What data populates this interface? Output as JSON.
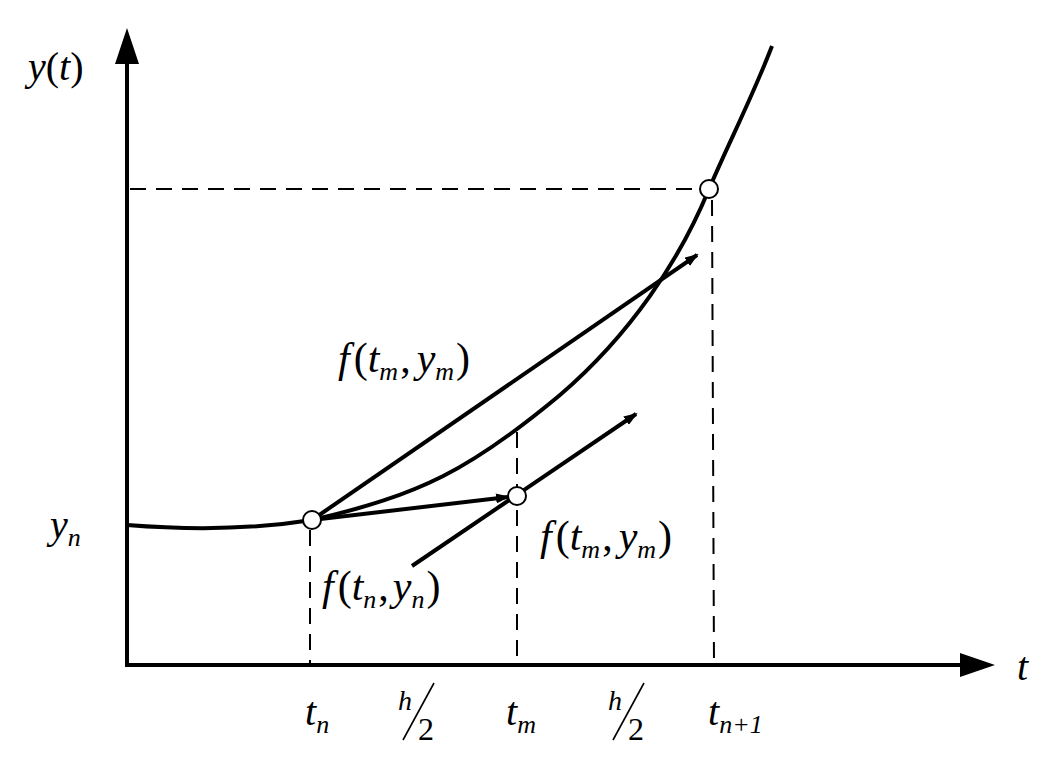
{
  "diagram": {
    "axes": {
      "y_label": {
        "main": "y",
        "open": "(",
        "arg": "t",
        "close": ")"
      },
      "x_label": "t",
      "y_tick": {
        "main": "y",
        "sub": "n"
      }
    },
    "x_ticks": [
      {
        "main": "t",
        "sub": "n"
      },
      {
        "main": "t",
        "sub": "m"
      },
      {
        "main": "t",
        "sub": "n+1"
      }
    ],
    "intervals": [
      {
        "num": "h",
        "den": "2"
      },
      {
        "num": "h",
        "den": "2"
      }
    ],
    "slope_labels": {
      "upper": {
        "f": "f",
        "open": "(",
        "t": "t",
        "t_sub": "m",
        "comma": ",",
        "y": "y",
        "y_sub": "m",
        "close": ")"
      },
      "middle": {
        "f": "f",
        "open": "(",
        "t": "t",
        "t_sub": "m",
        "comma": ",",
        "y": "y",
        "y_sub": "m",
        "close": ")"
      },
      "lower": {
        "f": "f",
        "open": "(",
        "t": "t",
        "t_sub": "n",
        "comma": ",",
        "y": "y",
        "y_sub": "n",
        "close": ")"
      }
    },
    "points": [
      {
        "name": "start-point",
        "x": 312,
        "y": 520
      },
      {
        "name": "midpoint",
        "x": 517,
        "y": 496
      },
      {
        "name": "end-point",
        "x": 709,
        "y": 189
      }
    ],
    "colors": {
      "stroke": "#000000",
      "background": "#ffffff",
      "point_fill": "#ffffff"
    }
  }
}
